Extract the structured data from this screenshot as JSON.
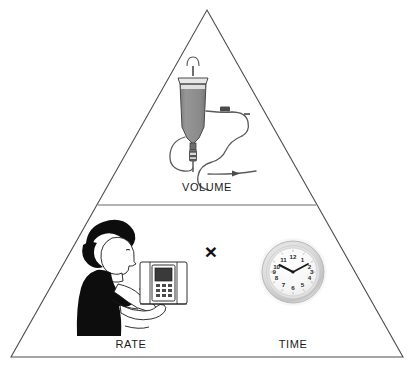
{
  "figure": {
    "type": "triangle-diagram",
    "background_color": "#ffffff",
    "outline_color": "#4d4d4d",
    "divider_color": "#6b6b6b"
  },
  "labels": {
    "volume": "VOLUME",
    "rate": "RATE",
    "time": "TIME"
  },
  "operator": {
    "symbol": "×",
    "meaning": "multiply"
  },
  "icons": {
    "iv_bag": "iv-bag-icon",
    "iv_tubing": "iv-tubing-icon",
    "nurse": "nurse-with-pump-icon",
    "infusion_pump": "infusion-pump-icon",
    "clock": "wall-clock-icon"
  },
  "clock": {
    "numerals": [
      "1",
      "2",
      "3",
      "4",
      "5",
      "6",
      "7",
      "8",
      "9",
      "10",
      "11",
      "12"
    ],
    "time_shown": "10:10",
    "hour_hand_position": 10,
    "minute_hand_position": 2,
    "face_color": "#f7f7f7",
    "bezel_color": "#d4d4d4",
    "hand_color": "#1a1a1a"
  },
  "colors": {
    "bag_fill": "#8c8c8c",
    "nurse_silhouette": "#0d0d0d",
    "line": "#4d4d4d",
    "pump_screen": "#3a3a3a"
  }
}
